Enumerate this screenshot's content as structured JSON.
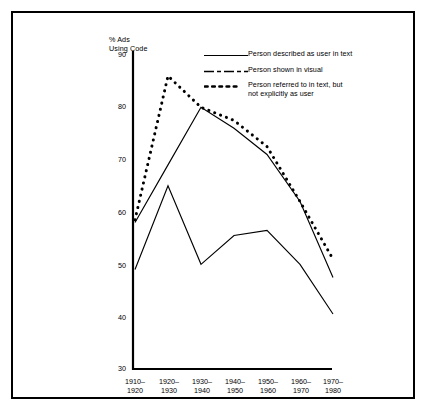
{
  "chart_data": {
    "type": "line",
    "title": "",
    "ylabel": "% Ads\nUsing Code",
    "xlabel": "",
    "categories": [
      "1910–\n1920",
      "1920–\n1930",
      "1930–\n1940",
      "1940–\n1950",
      "1950–\n1960",
      "1960–\n1970",
      "1970–\n1980"
    ],
    "ylim": [
      30,
      90
    ],
    "yticks": [
      30,
      40,
      50,
      60,
      70,
      80,
      90
    ],
    "grid": false,
    "legend_position": "top-right",
    "series": [
      {
        "name": "Person described as user in text",
        "style": "solid",
        "values": [
          49,
          65,
          50,
          55.5,
          56.5,
          50,
          40.5
        ]
      },
      {
        "name": "Person shown in visual",
        "style": "dash-dot",
        "values": [
          58,
          69,
          80,
          76,
          71,
          62,
          47.5
        ]
      },
      {
        "name": "Person referred to in text, but\nnot explicitly as user",
        "style": "dotted",
        "values": [
          58.5,
          86,
          80,
          77.5,
          72.5,
          62,
          51
        ]
      }
    ],
    "colors": {
      "line": "#000000",
      "axis": "#000000",
      "background": "#ffffff",
      "frame": "#000000"
    }
  },
  "legend": {
    "items": [
      {
        "label": "Person described as user in text",
        "key": "solid-line-key"
      },
      {
        "label": "Person shown in visual",
        "key": "dash-dot-line-key"
      },
      {
        "label": "Person referred to in text, but\nnot explicitly as user",
        "key": "dotted-line-key"
      }
    ]
  },
  "axes": {
    "y_title": "% Ads\nUsing Code",
    "y_labels": [
      "90",
      "80",
      "70",
      "60",
      "50",
      "40",
      "30"
    ],
    "x_labels": [
      "1910–\n1920",
      "1920–\n1930",
      "1930–\n1940",
      "1940–\n1950",
      "1950–\n1960",
      "1960–\n1970",
      "1970–\n1980"
    ]
  }
}
